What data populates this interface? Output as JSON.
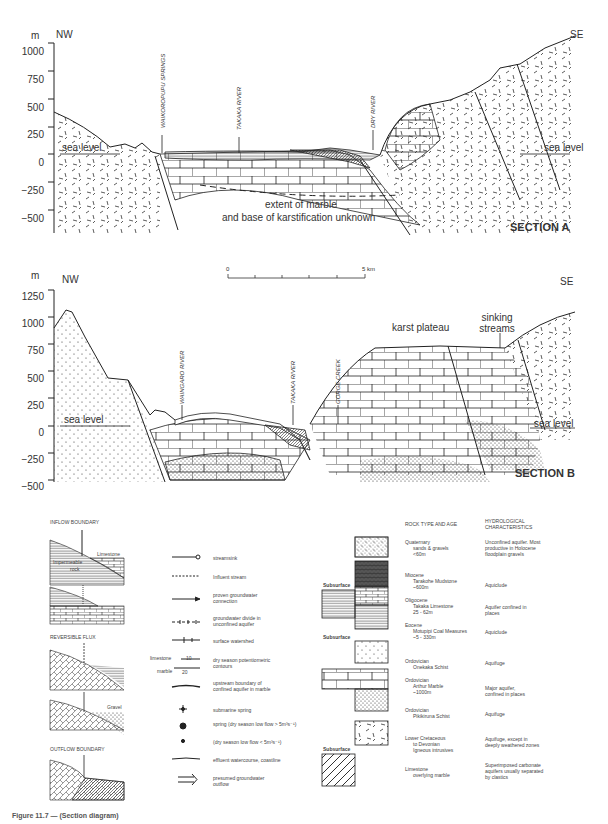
{
  "section_a": {
    "title": "SECTION A",
    "y_unit": "m",
    "left_dir": "NW",
    "right_dir": "SE",
    "y_ticks": [
      "1000",
      "750",
      "500",
      "250",
      "0",
      "−250",
      "−500"
    ],
    "labels": {
      "springs": "WAIKOROPUPU SPRINGS",
      "takaka": "TAKAKA RIVER",
      "dry": "DRY RIVER",
      "sea_left": "sea level",
      "sea_right": "sea level",
      "note_1": "extent of marble",
      "note_2": "and base of karstification unknown"
    }
  },
  "section_b": {
    "title": "SECTION B",
    "y_unit": "m",
    "left_dir": "NW",
    "right_dir": "SE",
    "y_ticks": [
      "1250",
      "1000",
      "750",
      "500",
      "250",
      "0",
      "−250",
      "−500"
    ],
    "labels": {
      "waingaro": "WAINGARO RIVER",
      "takaka": "TAKAKA RIVER",
      "gorge": "GORGE CREEK",
      "karst": "karst plateau",
      "sinking_1": "sinking",
      "sinking_2": "streams",
      "sea_left": "sea level",
      "sea_right": "sea level"
    }
  },
  "scale_bar": {
    "start": "0",
    "end": "5 km"
  },
  "boundaries": {
    "inflow": "INFLOW BOUNDARY",
    "reversible": "REVERSIBLE FLUX",
    "outflow": "OUTFLOW BOUNDARY",
    "limestone": "Limestone",
    "impermeable": "Impermeable",
    "rock": "rock",
    "gravel": "Gravel"
  },
  "symbols": [
    {
      "icon": "streamsink-icon",
      "label": "streamsink"
    },
    {
      "icon": "influent-stream-icon",
      "label": "Influent stream"
    },
    {
      "icon": "arrow-right-icon",
      "label": "proven groundwater connection"
    },
    {
      "icon": "groundwater-divide-icon",
      "label": "groundwater divide in unconfined aquifer"
    },
    {
      "icon": "surface-watershed-icon",
      "label": "surface watershed"
    },
    {
      "icon": "contour-icon",
      "label": "dry season potentiometric contours",
      "limestone": "limestone",
      "marble": "marble",
      "v1": "10",
      "v2": "20"
    },
    {
      "icon": "upstream-boundary-icon",
      "label": "upstream boundary of confined aquifer in marble"
    },
    {
      "icon": "submarine-spring-icon",
      "label": "submarine spring"
    },
    {
      "icon": "spring-large-icon",
      "label": "spring (dry season low flow > 5m³s⁻¹)"
    },
    {
      "icon": "spring-small-icon",
      "label": "(dry season low flow < 5m³s⁻¹)"
    },
    {
      "icon": "effluent-watercourse-icon",
      "label": "effluent watercourse, coastline"
    },
    {
      "icon": "double-arrow-icon",
      "label": "presumed groundwater outflow"
    }
  ],
  "rock_table": {
    "header_rock": "ROCK TYPE AND AGE",
    "header_hydro_1": "HYDROLOGICAL",
    "header_hydro_2": "CHARACTERISTICS",
    "subsurface": "Subsurface",
    "rows": [
      {
        "age": "Quaternary",
        "name": "sands & gravels",
        "thick": "<60m",
        "hydro": "Unconfined aquifer. Most productive in Holocene floodplain gravels"
      },
      {
        "age": "Miocene",
        "name": "Tarakohe Mudstone",
        "thick": "~600m",
        "hydro": "Aquiclude"
      },
      {
        "age": "Oligocene",
        "name": "Takaka Limestone",
        "thick": "25 - 62m",
        "hydro": "Aquifer confined in places"
      },
      {
        "age": "Eocene",
        "name": "Motupipi Coal Measures",
        "thick": "~5 - 330m",
        "hydro": "Aquiclude"
      },
      {
        "age": "Ordovician",
        "name": "Onekaka Schist",
        "thick": "",
        "hydro": "Aquifuge"
      },
      {
        "age": "Ordovician",
        "name": "Arthur Marble",
        "thick": "~1000m",
        "hydro": "Major aquifer, confined in places"
      },
      {
        "age": "Ordovician",
        "name": "Pikikiruna Schist",
        "thick": "",
        "hydro": "Aquifuge"
      },
      {
        "age": "Lower Cretaceous",
        "name": "to Devonian",
        "thick": "Igneous intrusives",
        "hydro": "Aquifuge, except in deeply weathered zones"
      },
      {
        "age": "Limestone",
        "name": "overlying marble",
        "thick": "",
        "hydro": "Superimposed carbonate aquifers usually separated by clastics"
      }
    ]
  },
  "caption": "Figure 11.7 — (Section diagram)"
}
